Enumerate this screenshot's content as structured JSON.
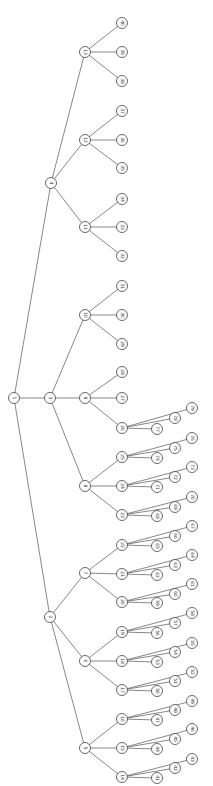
{
  "diagram": {
    "type": "tree",
    "orientation": "left-to-right (labels rotated)",
    "root": "1",
    "nodes": [
      {
        "id": "1",
        "x": 14,
        "y": 398
      },
      {
        "id": "2",
        "x": 50,
        "y": 617
      },
      {
        "id": "3",
        "x": 50,
        "y": 398
      },
      {
        "id": "4",
        "x": 51,
        "y": 183
      },
      {
        "id": "5",
        "x": 85,
        "y": 748
      },
      {
        "id": "6",
        "x": 85,
        "y": 661
      },
      {
        "id": "7",
        "x": 85,
        "y": 573
      },
      {
        "id": "8",
        "x": 85,
        "y": 486
      },
      {
        "id": "9",
        "x": 85,
        "y": 398
      },
      {
        "id": "10",
        "x": 85,
        "y": 315
      },
      {
        "id": "11",
        "x": 85,
        "y": 227
      },
      {
        "id": "12",
        "x": 85,
        "y": 140
      },
      {
        "id": "13",
        "x": 85,
        "y": 52
      },
      {
        "id": "14",
        "x": 122,
        "y": 777
      },
      {
        "id": "15",
        "x": 122,
        "y": 748
      },
      {
        "id": "16",
        "x": 122,
        "y": 719
      },
      {
        "id": "17",
        "x": 122,
        "y": 690
      },
      {
        "id": "18",
        "x": 122,
        "y": 661
      },
      {
        "id": "19",
        "x": 122,
        "y": 632
      },
      {
        "id": "20",
        "x": 122,
        "y": 602
      },
      {
        "id": "21",
        "x": 122,
        "y": 574
      },
      {
        "id": "22",
        "x": 122,
        "y": 545
      },
      {
        "id": "23",
        "x": 122,
        "y": 515
      },
      {
        "id": "24",
        "x": 122,
        "y": 486
      },
      {
        "id": "25",
        "x": 122,
        "y": 457
      },
      {
        "id": "26",
        "x": 122,
        "y": 428
      },
      {
        "id": "27",
        "x": 122,
        "y": 398
      },
      {
        "id": "28",
        "x": 122,
        "y": 372
      },
      {
        "id": "29",
        "x": 122,
        "y": 344
      },
      {
        "id": "30",
        "x": 122,
        "y": 315
      },
      {
        "id": "31",
        "x": 122,
        "y": 286
      },
      {
        "id": "32",
        "x": 122,
        "y": 256
      },
      {
        "id": "33",
        "x": 122,
        "y": 227
      },
      {
        "id": "34",
        "x": 122,
        "y": 199
      },
      {
        "id": "35",
        "x": 122,
        "y": 168
      },
      {
        "id": "36",
        "x": 122,
        "y": 140
      },
      {
        "id": "37",
        "x": 122,
        "y": 111
      },
      {
        "id": "38",
        "x": 122,
        "y": 81
      },
      {
        "id": "39",
        "x": 122,
        "y": 52
      },
      {
        "id": "40",
        "x": 122,
        "y": 23
      },
      {
        "id": "41",
        "x": 157,
        "y": 778
      },
      {
        "id": "42",
        "x": 175,
        "y": 768
      },
      {
        "id": "43",
        "x": 192,
        "y": 759
      },
      {
        "id": "44",
        "x": 157,
        "y": 749
      },
      {
        "id": "45",
        "x": 175,
        "y": 739
      },
      {
        "id": "46",
        "x": 192,
        "y": 729
      },
      {
        "id": "47",
        "x": 157,
        "y": 720
      },
      {
        "id": "48",
        "x": 175,
        "y": 710
      },
      {
        "id": "49",
        "x": 192,
        "y": 701
      },
      {
        "id": "50",
        "x": 157,
        "y": 691
      },
      {
        "id": "51",
        "x": 175,
        "y": 681
      },
      {
        "id": "52",
        "x": 192,
        "y": 672
      },
      {
        "id": "53",
        "x": 157,
        "y": 662
      },
      {
        "id": "54",
        "x": 175,
        "y": 652
      },
      {
        "id": "55",
        "x": 192,
        "y": 643
      },
      {
        "id": "56",
        "x": 157,
        "y": 633
      },
      {
        "id": "57",
        "x": 175,
        "y": 623
      },
      {
        "id": "58",
        "x": 192,
        "y": 613
      },
      {
        "id": "59",
        "x": 157,
        "y": 603
      },
      {
        "id": "60",
        "x": 175,
        "y": 594
      },
      {
        "id": "61",
        "x": 192,
        "y": 584
      },
      {
        "id": "62",
        "x": 157,
        "y": 575
      },
      {
        "id": "63",
        "x": 175,
        "y": 565
      },
      {
        "id": "64",
        "x": 192,
        "y": 555
      },
      {
        "id": "65",
        "x": 157,
        "y": 546
      },
      {
        "id": "66",
        "x": 175,
        "y": 536
      },
      {
        "id": "67",
        "x": 192,
        "y": 526
      },
      {
        "id": "68",
        "x": 157,
        "y": 516
      },
      {
        "id": "69",
        "x": 175,
        "y": 507
      },
      {
        "id": "70",
        "x": 192,
        "y": 497
      },
      {
        "id": "71",
        "x": 157,
        "y": 487
      },
      {
        "id": "72",
        "x": 175,
        "y": 477
      },
      {
        "id": "73",
        "x": 192,
        "y": 467
      },
      {
        "id": "74",
        "x": 157,
        "y": 458
      },
      {
        "id": "75",
        "x": 175,
        "y": 448
      },
      {
        "id": "76",
        "x": 192,
        "y": 438
      },
      {
        "id": "77",
        "x": 157,
        "y": 429
      },
      {
        "id": "78",
        "x": 175,
        "y": 418
      },
      {
        "id": "79",
        "x": 192,
        "y": 408
      }
    ],
    "edges": [
      [
        "1",
        "2"
      ],
      [
        "1",
        "3"
      ],
      [
        "1",
        "4"
      ],
      [
        "2",
        "5"
      ],
      [
        "2",
        "6"
      ],
      [
        "2",
        "7"
      ],
      [
        "3",
        "8"
      ],
      [
        "3",
        "9"
      ],
      [
        "3",
        "10"
      ],
      [
        "4",
        "11"
      ],
      [
        "4",
        "12"
      ],
      [
        "4",
        "13"
      ],
      [
        "5",
        "14"
      ],
      [
        "5",
        "15"
      ],
      [
        "5",
        "16"
      ],
      [
        "6",
        "17"
      ],
      [
        "6",
        "18"
      ],
      [
        "6",
        "19"
      ],
      [
        "7",
        "20"
      ],
      [
        "7",
        "21"
      ],
      [
        "7",
        "22"
      ],
      [
        "8",
        "23"
      ],
      [
        "8",
        "24"
      ],
      [
        "8",
        "25"
      ],
      [
        "9",
        "26"
      ],
      [
        "9",
        "27"
      ],
      [
        "9",
        "28"
      ],
      [
        "10",
        "29"
      ],
      [
        "10",
        "30"
      ],
      [
        "10",
        "31"
      ],
      [
        "11",
        "32"
      ],
      [
        "11",
        "33"
      ],
      [
        "11",
        "34"
      ],
      [
        "12",
        "35"
      ],
      [
        "12",
        "36"
      ],
      [
        "12",
        "37"
      ],
      [
        "13",
        "38"
      ],
      [
        "13",
        "39"
      ],
      [
        "13",
        "40"
      ],
      [
        "14",
        "41"
      ],
      [
        "14",
        "42"
      ],
      [
        "14",
        "43"
      ],
      [
        "15",
        "44"
      ],
      [
        "15",
        "45"
      ],
      [
        "15",
        "46"
      ],
      [
        "16",
        "47"
      ],
      [
        "16",
        "48"
      ],
      [
        "16",
        "49"
      ],
      [
        "17",
        "50"
      ],
      [
        "17",
        "51"
      ],
      [
        "17",
        "52"
      ],
      [
        "18",
        "53"
      ],
      [
        "18",
        "54"
      ],
      [
        "18",
        "55"
      ],
      [
        "19",
        "56"
      ],
      [
        "19",
        "57"
      ],
      [
        "19",
        "58"
      ],
      [
        "20",
        "59"
      ],
      [
        "20",
        "60"
      ],
      [
        "20",
        "61"
      ],
      [
        "21",
        "62"
      ],
      [
        "21",
        "63"
      ],
      [
        "21",
        "64"
      ],
      [
        "22",
        "65"
      ],
      [
        "22",
        "66"
      ],
      [
        "22",
        "67"
      ],
      [
        "23",
        "68"
      ],
      [
        "23",
        "69"
      ],
      [
        "23",
        "70"
      ],
      [
        "24",
        "71"
      ],
      [
        "24",
        "72"
      ],
      [
        "24",
        "73"
      ],
      [
        "25",
        "74"
      ],
      [
        "25",
        "75"
      ],
      [
        "25",
        "76"
      ],
      [
        "26",
        "77"
      ],
      [
        "26",
        "78"
      ],
      [
        "26",
        "79"
      ]
    ]
  }
}
